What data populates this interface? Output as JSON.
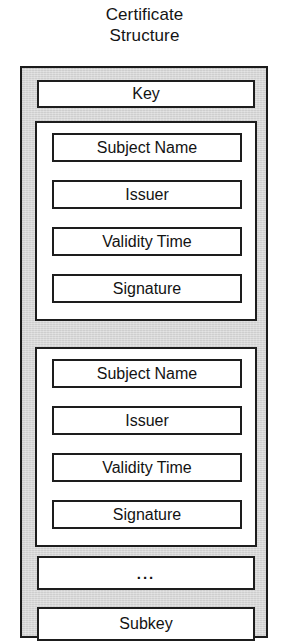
{
  "diagram": {
    "title_line1": "Certificate",
    "title_line2": "Structure",
    "colors": {
      "container_fill": "#d6d6d6",
      "box_fill": "#ffffff",
      "stroke": "#1d1d1d",
      "text": "#131313",
      "page_background": "#ffffff"
    },
    "top_level_boxes": {
      "key": "Key",
      "ellipsis": "...",
      "subkey": "Subkey"
    },
    "signature_groups": [
      {
        "index": 1,
        "items": [
          "Subject Name",
          "Issuer",
          "Validity Time",
          "Signature"
        ]
      },
      {
        "index": 2,
        "items": [
          "Subject Name",
          "Issuer",
          "Validity Time",
          "Signature"
        ]
      }
    ]
  }
}
